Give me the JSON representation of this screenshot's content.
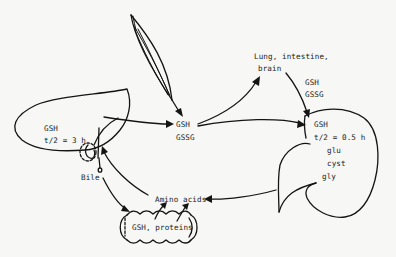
{
  "diagram": {
    "title": "",
    "organs": {
      "muscle": {
        "label": ""
      },
      "liver": {
        "gsh": "GSH",
        "half_life": "t/2 = 3 h"
      },
      "bile": {
        "label": "Bile"
      },
      "plasma": {
        "gsh": "GSH",
        "gssg": "GSSG"
      },
      "other_organs": {
        "line1": "Lung, intestine,",
        "line2": "brain",
        "gsh": "GSH",
        "gssg": "GSSG"
      },
      "kidney": {
        "gsh": "GSH",
        "half_life": "t/2 = 0.5 h",
        "products": [
          "glu",
          "cyst",
          "gly"
        ]
      },
      "amino_acids": {
        "label": "Amino acids"
      },
      "intestine": {
        "label": "GSH, proteins"
      }
    },
    "flows": [
      {
        "from": "muscle",
        "to": "plasma"
      },
      {
        "from": "liver",
        "to": "plasma"
      },
      {
        "from": "plasma",
        "to": "other_organs"
      },
      {
        "from": "plasma",
        "to": "kidney"
      },
      {
        "from": "other_organs",
        "to": "kidney"
      },
      {
        "from": "kidney",
        "to": "amino_acids"
      },
      {
        "from": "amino_acids",
        "to": "liver"
      },
      {
        "from": "bile",
        "to": "intestine"
      },
      {
        "from": "intestine",
        "to": "amino_acids"
      }
    ],
    "colors": {
      "ink": "#141414",
      "paper": "#f7f7f5"
    }
  }
}
